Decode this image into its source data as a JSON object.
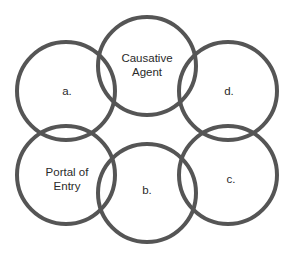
{
  "diagram": {
    "type": "chain-of-infection-circles",
    "colors": {
      "stroke": "#555555",
      "text": "#2a2a2a",
      "background": "#ffffff"
    },
    "nodes": [
      {
        "id": "causative-agent",
        "lines": [
          "Causative",
          "Agent"
        ]
      },
      {
        "id": "a",
        "lines": [
          "a."
        ]
      },
      {
        "id": "d",
        "lines": [
          "d."
        ]
      },
      {
        "id": "portal-of-entry",
        "lines": [
          "Portal of",
          "Entry"
        ]
      },
      {
        "id": "b",
        "lines": [
          "b."
        ]
      },
      {
        "id": "c",
        "lines": [
          "c."
        ]
      }
    ]
  }
}
